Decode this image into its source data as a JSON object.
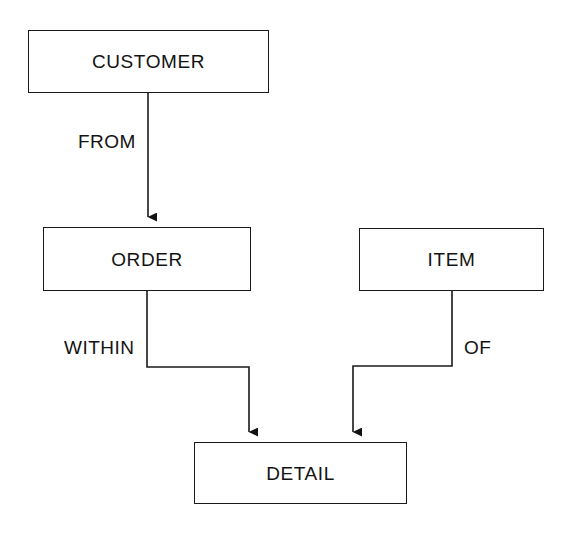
{
  "diagram": {
    "type": "entity-relationship-data-structure-diagram",
    "background_color": "#ffffff",
    "line_color": "#1a1a1a",
    "text_color": "#131313",
    "entities": [
      {
        "id": "customer",
        "label": "CUSTOMER",
        "x": 28,
        "y": 30,
        "width": 241,
        "height": 63
      },
      {
        "id": "order",
        "label": "ORDER",
        "x": 43,
        "y": 227,
        "width": 208,
        "height": 64
      },
      {
        "id": "item",
        "label": "ITEM",
        "x": 359,
        "y": 228,
        "width": 185,
        "height": 63
      },
      {
        "id": "detail",
        "label": "DETAIL",
        "x": 194,
        "y": 442,
        "width": 213,
        "height": 62
      }
    ],
    "relationships": [
      {
        "id": "from",
        "label": "FROM",
        "source": "customer",
        "target": "order",
        "label_x": 78,
        "label_y": 132
      },
      {
        "id": "within",
        "label": "WITHIN",
        "source": "order",
        "target": "detail",
        "label_x": 64,
        "label_y": 338
      },
      {
        "id": "of",
        "label": "OF",
        "source": "item",
        "target": "detail",
        "label_x": 464,
        "label_y": 338
      }
    ]
  }
}
